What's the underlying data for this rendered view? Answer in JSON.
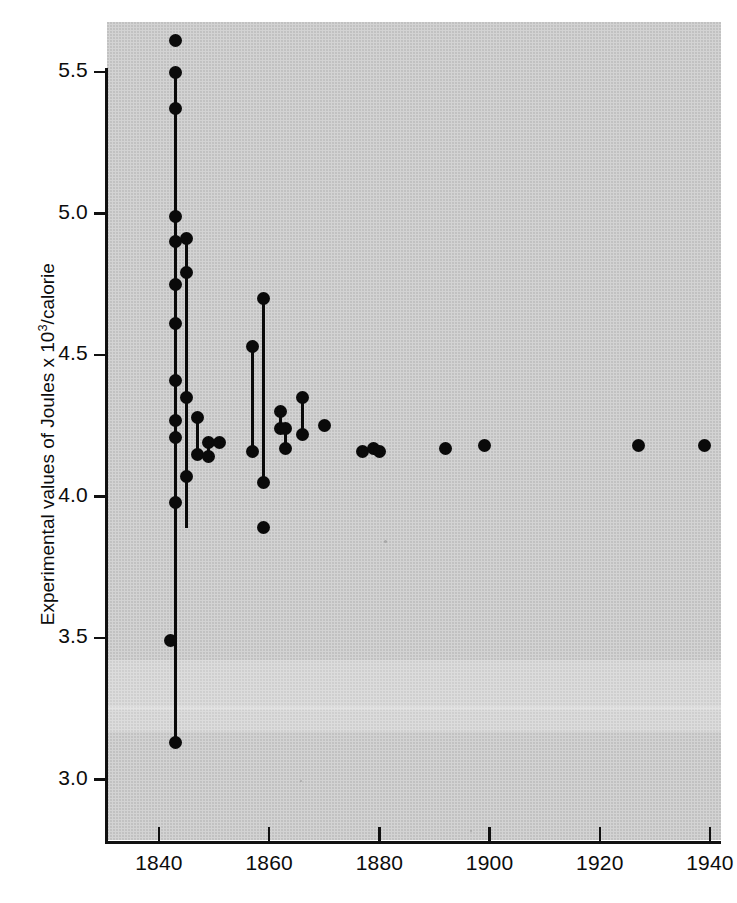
{
  "figure": {
    "background_color": "#d3d3d3",
    "ink_color": "#0a0a0a"
  },
  "chart_data": {
    "type": "scatter",
    "title": "",
    "subtitle": "",
    "xlabel": "",
    "ylabel": "Experimental values of Joules x 10³/calorie",
    "ylabel_parts": {
      "pre": "Experimental values of Joules x 10",
      "sup": "3",
      "post": "/calorie"
    },
    "xlim": [
      1830,
      1943
    ],
    "ylim": [
      2.82,
      5.72
    ],
    "grid": false,
    "legend": null,
    "xticks": [
      1840,
      1860,
      1880,
      1900,
      1920,
      1940
    ],
    "xticklabels": [
      "1840",
      "1860",
      "1880",
      "1900",
      "1920",
      "1940"
    ],
    "yticks": [
      3.0,
      3.5,
      4.0,
      4.5,
      5.0,
      5.5
    ],
    "yticklabels": [
      "3.0",
      "3.5",
      "4.0",
      "4.5",
      "5.0",
      "5.5"
    ],
    "points": [
      {
        "x": 1843,
        "y": 5.61
      },
      {
        "x": 1843,
        "y": 5.5
      },
      {
        "x": 1843,
        "y": 5.37
      },
      {
        "x": 1843,
        "y": 4.99
      },
      {
        "x": 1843,
        "y": 4.9
      },
      {
        "x": 1845,
        "y": 4.91
      },
      {
        "x": 1845,
        "y": 4.79
      },
      {
        "x": 1843,
        "y": 4.75
      },
      {
        "x": 1843,
        "y": 4.61
      },
      {
        "x": 1843,
        "y": 4.41
      },
      {
        "x": 1845,
        "y": 4.35
      },
      {
        "x": 1843,
        "y": 4.27
      },
      {
        "x": 1843,
        "y": 4.21
      },
      {
        "x": 1847,
        "y": 4.28
      },
      {
        "x": 1847,
        "y": 4.15
      },
      {
        "x": 1849,
        "y": 4.19
      },
      {
        "x": 1849,
        "y": 4.14
      },
      {
        "x": 1851,
        "y": 4.19
      },
      {
        "x": 1845,
        "y": 4.07
      },
      {
        "x": 1843,
        "y": 3.98
      },
      {
        "x": 1842,
        "y": 3.49
      },
      {
        "x": 1843,
        "y": 3.13
      },
      {
        "x": 1857,
        "y": 4.53
      },
      {
        "x": 1859,
        "y": 4.7
      },
      {
        "x": 1857,
        "y": 4.16
      },
      {
        "x": 1859,
        "y": 4.05
      },
      {
        "x": 1859,
        "y": 3.89
      },
      {
        "x": 1862,
        "y": 4.3
      },
      {
        "x": 1862,
        "y": 4.24
      },
      {
        "x": 1863,
        "y": 4.24
      },
      {
        "x": 1863,
        "y": 4.17
      },
      {
        "x": 1866,
        "y": 4.35
      },
      {
        "x": 1866,
        "y": 4.22
      },
      {
        "x": 1870,
        "y": 4.25
      },
      {
        "x": 1877,
        "y": 4.16
      },
      {
        "x": 1879,
        "y": 4.17
      },
      {
        "x": 1880,
        "y": 4.16
      },
      {
        "x": 1892,
        "y": 4.17
      },
      {
        "x": 1899,
        "y": 4.18
      },
      {
        "x": 1927,
        "y": 4.18
      },
      {
        "x": 1939,
        "y": 4.18
      }
    ],
    "connectors": [
      {
        "x": 1843,
        "y0": 5.5,
        "y1": 3.13
      },
      {
        "x": 1845,
        "y0": 4.91,
        "y1": 3.89
      },
      {
        "x": 1847,
        "y0": 4.28,
        "y1": 4.15
      },
      {
        "x": 1849,
        "y0": 4.19,
        "y1": 4.14
      },
      {
        "x": 1857,
        "y0": 4.53,
        "y1": 4.16
      },
      {
        "x": 1859,
        "y0": 4.7,
        "y1": 4.05
      },
      {
        "x": 1862,
        "y0": 4.3,
        "y1": 4.24
      },
      {
        "x": 1863,
        "y0": 4.24,
        "y1": 4.17
      },
      {
        "x": 1866,
        "y0": 4.35,
        "y1": 4.22
      }
    ]
  }
}
